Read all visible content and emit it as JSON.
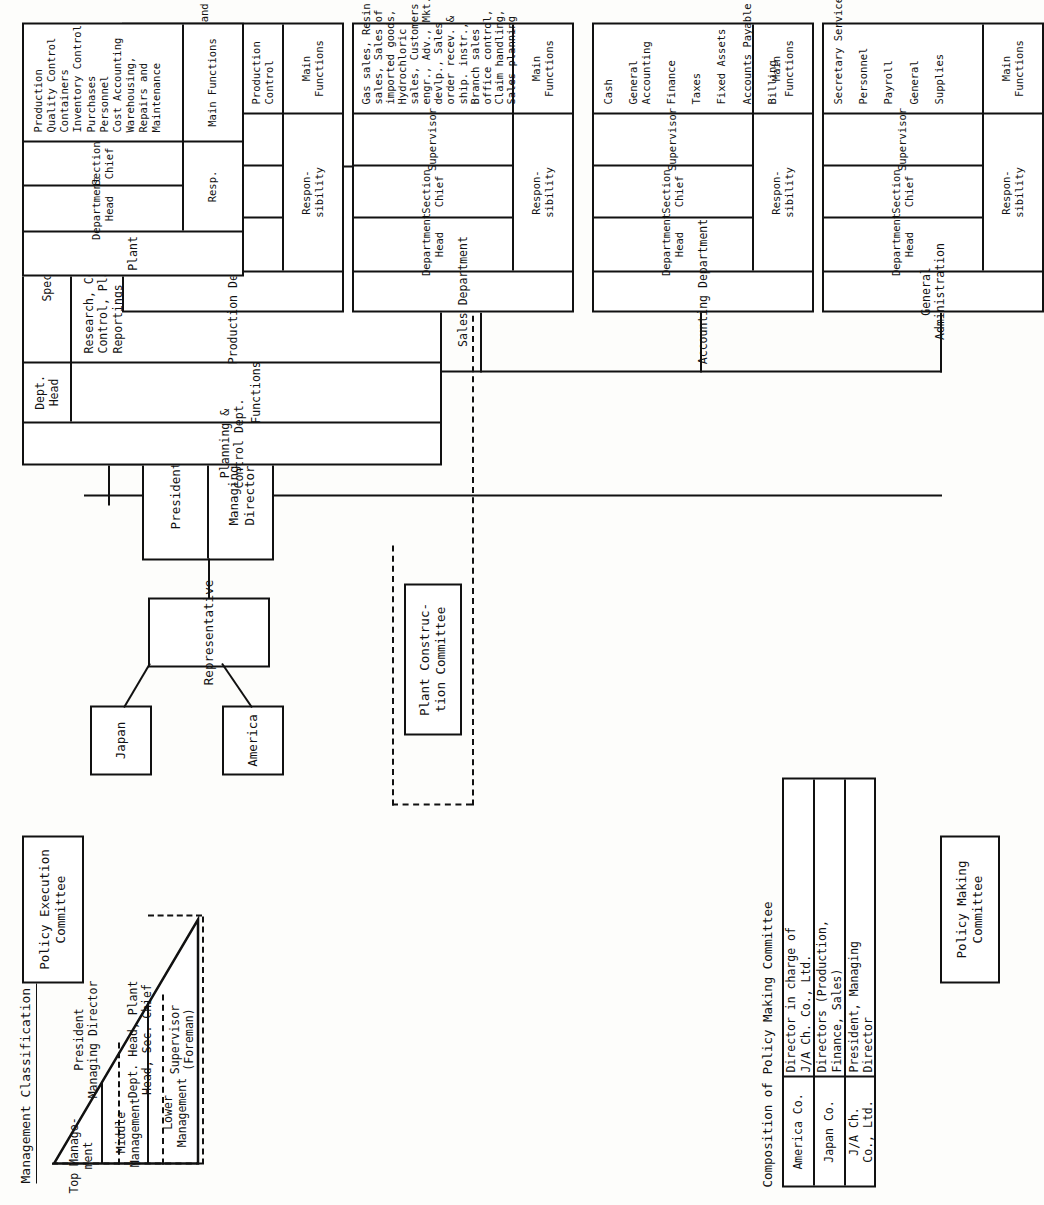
{
  "document": {
    "title": "Organization Chart",
    "orientation": "landscape-rotated-90"
  },
  "management_classification": {
    "heading": "Management Classification",
    "triangle_levels": [
      {
        "label": "Top Manage-\nment"
      },
      {
        "label": "Middle\nManagement"
      },
      {
        "label": "Lower\nManagement"
      }
    ],
    "role_groups": [
      {
        "label": "President\nManaging Director"
      },
      {
        "label": "Dept. Head, Plant\nHead, Sec. Chief"
      },
      {
        "label": "Supervisor\n(Foreman)"
      }
    ]
  },
  "committees": {
    "policy_making": "Policy Making\nCommittee",
    "policy_execution": "Policy Execution\nCommittee",
    "plant_construction": "Plant Construc-\ntion Committee"
  },
  "shareholders": {
    "japan": "Japan",
    "america": "America",
    "representative": "Representative"
  },
  "executive": {
    "president": "President",
    "managing_director": "Managing Director"
  },
  "planning_dept": {
    "name": "Planning &\nControl Dept.",
    "responsibility_label": "Functions",
    "roles": [
      {
        "label": "Dept.\nHead"
      },
      {
        "label": "Specialists"
      }
    ],
    "functions": "Research, Coordination,\nControl, Planning, Budget,\nReportings"
  },
  "pmc_table": {
    "title": "Composition of Policy Making Committee",
    "rows": [
      {
        "party": "America Co.",
        "members": "Director in charge of\nJ/A Ch. Co., Ltd."
      },
      {
        "party": "Japan Co.",
        "members": "Directors (Production,\nFinance, Sales)"
      },
      {
        "party": "J/A Ch.\nCo., Ltd.",
        "members": "President, Managing\nDirector"
      }
    ]
  },
  "labels": {
    "responsibility": "Respon-\nsibility",
    "responsibility_short": "Resp.",
    "main_functions": "Main Functions"
  },
  "departments": [
    {
      "name": "General\nAdministration",
      "roles": [
        "Department Head",
        "Section Chief",
        "Supervisor"
      ],
      "resp_label": "Respon-\nsibility",
      "func_label": "Main Functions",
      "functions": "Secretary Service\n\nPersonnel\n\nPayroll\n\nGeneral\n\nSupplies"
    },
    {
      "name": "Accounting Department",
      "roles": [
        "Department Head",
        "Section Chief",
        "Supervisor"
      ],
      "resp_label": "Respon-\nsibility",
      "func_label": "Main Functions",
      "functions": "Cash\n\nGeneral\nAccounting\n\nFinance\n\nTaxes\n\nFixed Assets\n\nAccounts Payable\n\nBilling"
    },
    {
      "name": "Sales Department",
      "roles": [
        "Department Head",
        "Section Chief",
        "Supervisor"
      ],
      "resp_label": "Respon-\nsibility",
      "func_label": "Main Functions",
      "functions": "Gas sales, Resin\nsales, Sales of\nimported goods,\nHydrochloric\nsales, Customers\nengr., Adv., Mkt.\ndevlp., Sales\norder recev. &\nship. instr.,\nBranch sales\noffice control,\nClaim handling,\nSales planning"
    },
    {
      "name": "Production Department",
      "roles": [
        "Department Head",
        "Section Chief",
        "Supervisor"
      ],
      "resp_label": "Respon-\nsibility",
      "func_label": "Main Functions",
      "functions": "Production\nPlanning\n\nResearch\n\nConstruction and\nRepairing\nPlans\n\nProduction\nControl"
    },
    {
      "name": "Plant",
      "roles": [
        "Department Head",
        "Section Chief"
      ],
      "resp_label": "Resp.",
      "func_label": "Main Functions",
      "functions": "Production\nQuality Control\nContainers\nInventory Control\nPurchases\nPersonnel\nCost Accounting\nWarehousing,\nRepairs and\nMaintenance"
    }
  ]
}
